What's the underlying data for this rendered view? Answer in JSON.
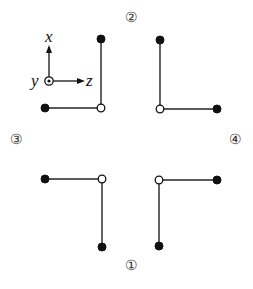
{
  "diagram": {
    "axes": {
      "x_label": "x",
      "y_label": "y",
      "z_label": "z",
      "y_direction": "out-of-page (dot in circle)"
    },
    "panels": [
      {
        "id": "2",
        "label": "②",
        "label_pos": [
          131,
          17
        ],
        "shape": "L-bend",
        "open_node": [
          160,
          109
        ],
        "filled_nodes": [
          [
            160,
            40
          ],
          [
            217,
            109
          ]
        ]
      },
      {
        "id": "3",
        "label": "③",
        "label_pos": [
          16,
          139
        ],
        "shape": "L-bend",
        "open_node": [
          102,
          179
        ],
        "filled_nodes": [
          [
            45,
            179
          ],
          [
            102,
            247
          ]
        ]
      },
      {
        "id": "4",
        "label": "④",
        "label_pos": [
          235,
          139
        ],
        "shape": "L-bend",
        "open_node": [
          159,
          180
        ],
        "filled_nodes": [
          [
            217,
            180
          ],
          [
            159,
            246
          ]
        ]
      },
      {
        "id": "1",
        "label": "①",
        "label_pos": [
          131,
          265
        ],
        "shape": "L-bend",
        "open_node": null,
        "filled_nodes": []
      }
    ],
    "reference_shape": {
      "open_node": [
        101,
        108
      ],
      "filled_nodes": [
        [
          101,
          39
        ],
        [
          45,
          108
        ]
      ]
    },
    "colors": {
      "line": "#222222",
      "node_fill": "#111111",
      "open_fill": "#ffffff",
      "label": "#333333"
    }
  }
}
